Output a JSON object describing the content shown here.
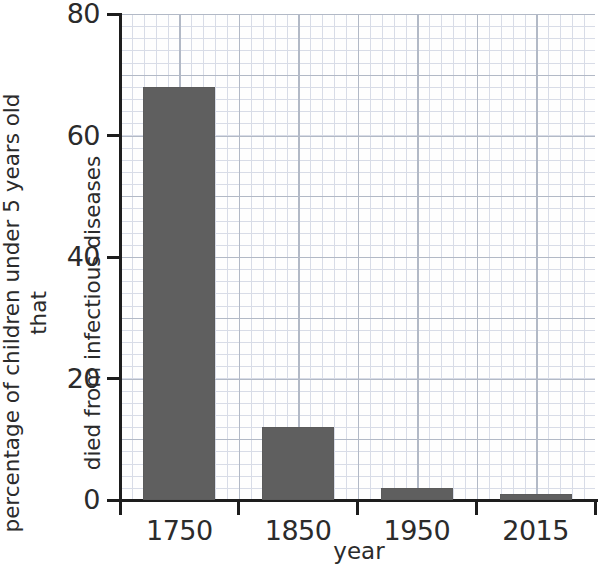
{
  "chart_data": {
    "type": "bar",
    "title": "",
    "categories": [
      "1750",
      "1850",
      "1950",
      "2015"
    ],
    "values": [
      68,
      12,
      2,
      1
    ],
    "xlabel": "year",
    "ylabel_lines": [
      "percentage of children under 5 years old that",
      "died from infectious diseases"
    ],
    "ylabel": "percentage of children under 5 years old that died from infectious diseases",
    "ylim": [
      0,
      80
    ],
    "yticks": [
      0,
      20,
      40,
      60,
      80
    ],
    "ytick_labels": [
      "0",
      "20",
      "40",
      "60",
      "80"
    ],
    "grid": true,
    "grid_style": "graph-paper",
    "legend": "none",
    "bar_color": "#5f5f5f",
    "axis_color": "#1d1d1d",
    "grid_major_color": "#9aa3b4",
    "grid_minor_color": "#ccd2e0",
    "background_color": "#ffffff"
  }
}
